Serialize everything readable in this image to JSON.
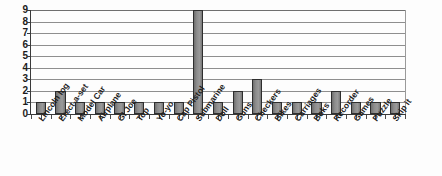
{
  "chart_data": {
    "type": "bar",
    "title": "",
    "subtitle": "",
    "xlabel": "",
    "ylabel": "",
    "ylim": [
      0,
      9
    ],
    "y_ticks": [
      0,
      1,
      2,
      3,
      4,
      5,
      6,
      7,
      8,
      9
    ],
    "grid": true,
    "legend": false,
    "legend_position": "none",
    "bar_color": "#8a8a8a",
    "bar_border_color": "#2e2e2e",
    "gridline_color": "#8e8e8e",
    "axis_color": "#3a3a3a",
    "categories": [
      "Lincoln log",
      "Erect-a-set",
      "Model Car",
      "Airplane",
      "GI Joe",
      "Top",
      "Yo-yo",
      "Cap Pistol",
      "Submarine",
      "Doll",
      "Guns",
      "Checkers",
      "Bikes",
      "Carriages",
      "Boks",
      "Recorder",
      "Games",
      "Puzzle",
      "Skip it"
    ],
    "values": [
      1,
      2,
      1,
      1,
      1,
      1,
      1,
      1,
      9,
      1,
      2,
      3,
      1,
      1,
      1,
      2,
      1,
      1,
      1
    ]
  }
}
